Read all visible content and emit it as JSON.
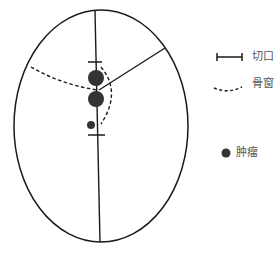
{
  "diagram": {
    "title": "",
    "colors": {
      "stroke": "#1a1a1a",
      "tumor": "#333333",
      "label": "#555555"
    },
    "skull_outline": {
      "shape": "ellipse",
      "cx": 101,
      "cy": 126,
      "rx": 87,
      "ry": 116
    },
    "midline": {
      "x1": 95,
      "y1": 11,
      "x2": 100,
      "y2": 242
    },
    "incision": {
      "label": "切口",
      "ticks": [
        {
          "x1": 88,
          "y1": 62,
          "x2": 102,
          "y2": 62
        },
        {
          "x1": 88,
          "y1": 135,
          "x2": 105,
          "y2": 135
        }
      ]
    },
    "coronal_line": {
      "x1": 99,
      "y1": 90,
      "x2": 165,
      "y2": 48
    },
    "bone_window": {
      "label": "骨窗",
      "paths": [
        "M31,67 Q60,84 97,90",
        "M101,67 Q122,92 101,124"
      ]
    },
    "tumors": {
      "label": "肿瘤",
      "items": [
        {
          "cx": 96,
          "cy": 78,
          "r": 8
        },
        {
          "cx": 96,
          "cy": 99,
          "r": 8
        },
        {
          "cx": 91,
          "cy": 125,
          "r": 4
        }
      ]
    }
  },
  "legend": {
    "items": [
      {
        "symbol": "incision-bar",
        "label": "切口"
      },
      {
        "symbol": "dashed-curve",
        "label": "骨窗"
      },
      {
        "symbol": "filled-dot",
        "label": "肿瘤"
      }
    ]
  }
}
